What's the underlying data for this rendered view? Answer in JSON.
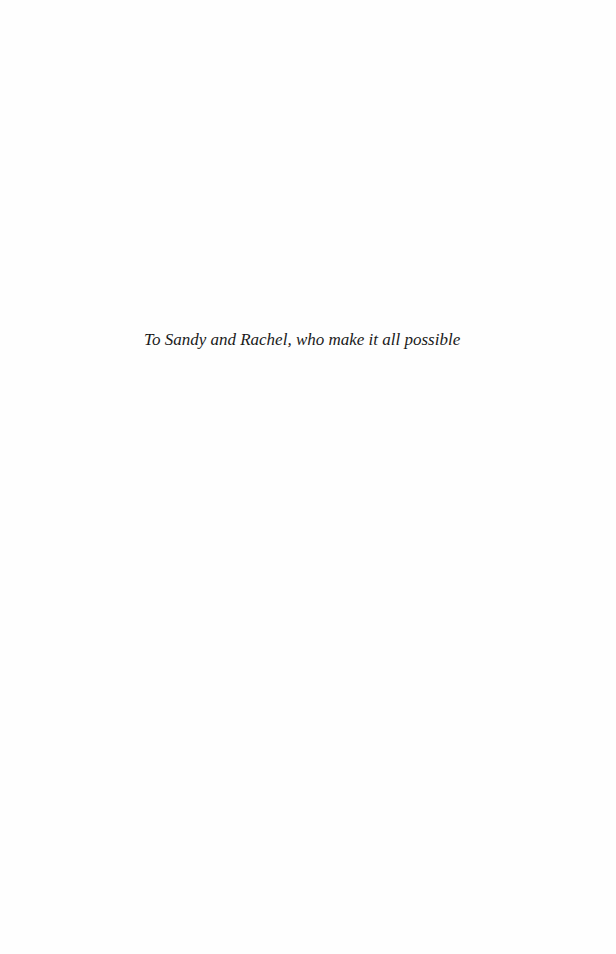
{
  "page": {
    "dedication": "To Sandy and Rachel, who make it all possible"
  }
}
